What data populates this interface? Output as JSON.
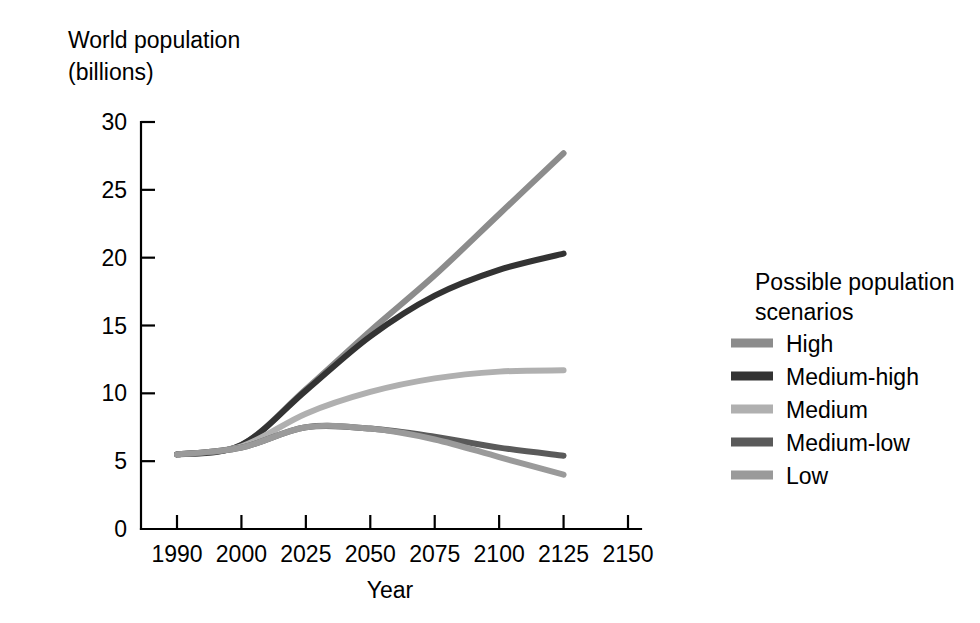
{
  "chart_data": {
    "type": "line",
    "title": "",
    "ylabel_line1": "World population",
    "ylabel_line2": "(billions)",
    "xlabel": "Year",
    "grid": false,
    "legend_position": "right",
    "x_tick_labels": [
      "1990",
      "2000",
      "2025",
      "2050",
      "2075",
      "2100",
      "2125",
      "2150"
    ],
    "x": [
      1990,
      2000,
      2025,
      2050,
      2075,
      2100,
      2125,
      2150
    ],
    "y_tick_labels": [
      "0",
      "5",
      "10",
      "15",
      "20",
      "25",
      "30"
    ],
    "ylim": [
      0,
      30
    ],
    "y_ticks": [
      0,
      5,
      10,
      15,
      20,
      25,
      30
    ],
    "series": [
      {
        "name": "High",
        "color": "#8c8c8c",
        "x": [
          1990,
          2000,
          2025,
          2050,
          2075,
          2100,
          2125
        ],
        "values": [
          5.5,
          6.2,
          10.3,
          14.6,
          18.7,
          23.2,
          27.7
        ]
      },
      {
        "name": "Medium-high",
        "color": "#333333",
        "x": [
          1990,
          2000,
          2025,
          2050,
          2075,
          2100,
          2125
        ],
        "values": [
          5.5,
          6.2,
          10.2,
          14.2,
          17.2,
          19.1,
          20.3
        ]
      },
      {
        "name": "Medium",
        "color": "#b0b0b0",
        "x": [
          1990,
          2000,
          2025,
          2050,
          2075,
          2100,
          2125
        ],
        "values": [
          5.5,
          6.1,
          8.5,
          10.1,
          11.1,
          11.6,
          11.7
        ]
      },
      {
        "name": "Medium-low",
        "color": "#5a5a5a",
        "x": [
          1990,
          2000,
          2025,
          2050,
          2075,
          2100,
          2125
        ],
        "values": [
          5.5,
          6.0,
          7.5,
          7.4,
          6.8,
          6.0,
          5.4
        ]
      },
      {
        "name": "Low",
        "color": "#9a9a9a",
        "x": [
          1990,
          2000,
          2025,
          2050,
          2075,
          2100,
          2125
        ],
        "values": [
          5.5,
          6.0,
          7.5,
          7.4,
          6.6,
          5.3,
          4.0
        ]
      }
    ]
  },
  "legend": {
    "title_line1": "Possible population",
    "title_line2": "scenarios",
    "items": [
      {
        "label": "High",
        "color": "#8c8c8c"
      },
      {
        "label": "Medium-high",
        "color": "#333333"
      },
      {
        "label": "Medium",
        "color": "#b0b0b0"
      },
      {
        "label": "Medium-low",
        "color": "#5a5a5a"
      },
      {
        "label": "Low",
        "color": "#9a9a9a"
      }
    ]
  },
  "colors": {
    "axis": "#000000",
    "background": "#ffffff",
    "text": "#000000"
  }
}
